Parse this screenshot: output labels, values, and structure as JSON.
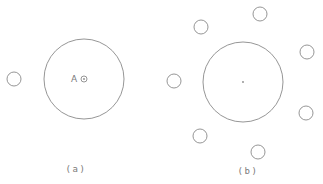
{
  "diagram": {
    "colors": {
      "stroke": "#8a8a8a",
      "text": "#7a7a7a",
      "background": "#ffffff"
    },
    "panels": [
      {
        "id": "a",
        "caption": "(a)",
        "caption_pos": {
          "x": 76,
          "y": 172
        },
        "large_circle": {
          "cx": 84,
          "cy": 79,
          "r": 40
        },
        "center_marker": {
          "cx": 84,
          "cy": 79,
          "r": 3,
          "label": "A",
          "label_pos": {
            "x": 71,
            "y": 82
          }
        },
        "small_circles": [
          {
            "cx": 14,
            "cy": 79,
            "r": 7
          }
        ]
      },
      {
        "id": "b",
        "caption": "(b)",
        "caption_pos": {
          "x": 248,
          "y": 174
        },
        "large_circle": {
          "cx": 243,
          "cy": 82,
          "r": 40
        },
        "center_dot": {
          "cx": 243,
          "cy": 82,
          "r": 0.9
        },
        "small_circles": [
          {
            "cx": 201,
            "cy": 27,
            "r": 7
          },
          {
            "cx": 260,
            "cy": 14,
            "r": 7
          },
          {
            "cx": 307,
            "cy": 52,
            "r": 7
          },
          {
            "cx": 174,
            "cy": 81,
            "r": 7
          },
          {
            "cx": 306,
            "cy": 113,
            "r": 7
          },
          {
            "cx": 200,
            "cy": 136,
            "r": 7
          },
          {
            "cx": 258,
            "cy": 152,
            "r": 7
          }
        ]
      }
    ]
  }
}
